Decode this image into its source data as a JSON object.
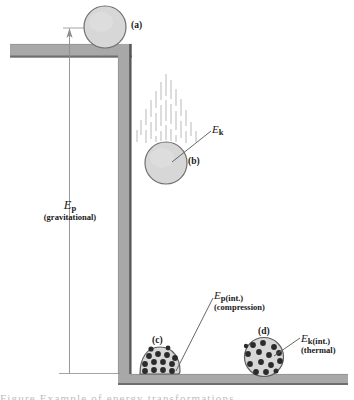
{
  "figure": {
    "type": "physics-diagram",
    "background_color": "#ffffff",
    "structure": {
      "shelf_color": "#a8a8a8",
      "shelf_edge_color": "#5a5a5a",
      "wall_color": "#a8a8a8",
      "wall_edge_color": "#4d4d4d",
      "floor_color": "#a8a8a8"
    },
    "ball": {
      "fill_color": "#d7d7d7",
      "outline_color": "#707070",
      "particle_color": "#2b2b2b"
    },
    "motion_lines_color": "#b9b9b9",
    "leader_line_color": "#555555"
  },
  "labels": {
    "part_a": "(a)",
    "part_b": "(b)",
    "part_c": "(c)",
    "part_d": "(d)"
  },
  "energies": {
    "gravitational": {
      "symbol": "E",
      "subscript": "p",
      "qualifier": "(gravitational)"
    },
    "kinetic": {
      "symbol": "E",
      "subscript": "k",
      "qualifier": ""
    },
    "compression": {
      "symbol": "E",
      "subscript": "p(int.)",
      "qualifier": "(compression)"
    },
    "thermal": {
      "symbol": "E",
      "subscript": "k(int.)",
      "qualifier": "(thermal)"
    }
  },
  "caption": {
    "cut_off_text": "Figure    Example of energy transformations"
  }
}
